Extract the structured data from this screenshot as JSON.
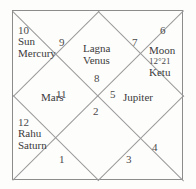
{
  "chart": {
    "type": "north-indian-vedic-rasi-chart",
    "title": "",
    "houses": [
      {
        "number": "1",
        "planets": []
      },
      {
        "number": "2",
        "planets": []
      },
      {
        "number": "3",
        "planets": []
      },
      {
        "number": "4",
        "planets": []
      },
      {
        "number": "5",
        "planets": [
          "Jupiter"
        ]
      },
      {
        "number": "6",
        "planets": [
          "Moon",
          "Ketu"
        ],
        "degree": "12°21"
      },
      {
        "number": "7",
        "planets": []
      },
      {
        "number": "8",
        "planets": []
      },
      {
        "number": "9",
        "planets": [
          "Lagna",
          "Venus"
        ]
      },
      {
        "number": "10",
        "planets": [
          "Sun",
          "Mercury"
        ]
      },
      {
        "number": "11",
        "planets": [
          "Mars"
        ]
      },
      {
        "number": "12",
        "planets": [
          "Rahu",
          "Saturn"
        ]
      }
    ],
    "labels": {
      "house_10": "10",
      "house_9": "9",
      "house_7": "7",
      "house_6": "6",
      "house_8": "8",
      "house_11": "11",
      "house_5": "5",
      "house_2": "2",
      "house_12": "12",
      "house_1": "1",
      "house_3": "3",
      "house_4": "4",
      "sun": "Sun",
      "mercury": "Mercury",
      "lagna": "Lagna",
      "venus": "Venus",
      "moon": "Moon",
      "moon_degree": "12°21",
      "ketu": "Ketu",
      "mars": "Mars",
      "jupiter": "Jupiter",
      "rahu": "Rahu",
      "saturn": "Saturn"
    },
    "colors": {
      "line": "#9a9a9a",
      "border": "#8c8c8c",
      "text": "#3b3b3b",
      "background": "#fdfdfc"
    }
  }
}
